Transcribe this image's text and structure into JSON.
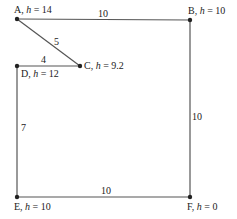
{
  "diagram": {
    "type": "network",
    "nodes": [
      {
        "id": "A",
        "letter": "A",
        "h_prefix": ", ",
        "h_var": "h",
        "h_eq": " = 14",
        "h": 14,
        "x": 17,
        "y": 19
      },
      {
        "id": "B",
        "letter": "B",
        "h_prefix": ", ",
        "h_var": "h",
        "h_eq": " = 10",
        "h": 10,
        "x": 190,
        "y": 20
      },
      {
        "id": "C",
        "letter": "C",
        "h_prefix": ", ",
        "h_var": "h",
        "h_eq": " = 9.2",
        "h": 9.2,
        "x": 80,
        "y": 66
      },
      {
        "id": "D",
        "letter": "D",
        "h_prefix": ", ",
        "h_var": "h",
        "h_eq": " = 12",
        "h": 12,
        "x": 17,
        "y": 66
      },
      {
        "id": "E",
        "letter": "E",
        "h_prefix": ", ",
        "h_var": "h",
        "h_eq": " = 10",
        "h": 10,
        "x": 17,
        "y": 197
      },
      {
        "id": "F",
        "letter": "F",
        "h_prefix": ", ",
        "h_var": "h",
        "h_eq": " = 0",
        "h": 0,
        "x": 190,
        "y": 197
      }
    ],
    "edges": [
      {
        "from": "A",
        "to": "B",
        "weight": "10"
      },
      {
        "from": "A",
        "to": "C",
        "weight": "5"
      },
      {
        "from": "D",
        "to": "C",
        "weight": "4"
      },
      {
        "from": "D",
        "to": "E",
        "weight": "7"
      },
      {
        "from": "B",
        "to": "F",
        "weight": "10"
      },
      {
        "from": "E",
        "to": "F",
        "weight": "10"
      }
    ],
    "colors": {
      "edge": "#555555",
      "node": "#222222",
      "text": "#222222",
      "background": "#ffffff"
    }
  }
}
